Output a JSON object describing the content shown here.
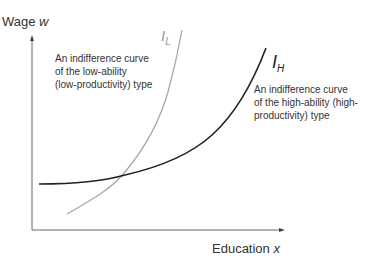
{
  "diagram": {
    "y_axis_label": "Wage",
    "y_axis_var": "w",
    "x_axis_label": "Education",
    "x_axis_var": "x",
    "curves": [
      {
        "id": "IL",
        "symbol": "I",
        "subscript": "L",
        "color": "#a8a8a8",
        "note": "An indifference curve\nof the low-ability\n(low-productivity) type"
      },
      {
        "id": "IH",
        "symbol": "I",
        "subscript": "H",
        "color": "#222222",
        "note": "An indifference curve\nof the high-ability (high-\nproductivity) type"
      }
    ]
  }
}
